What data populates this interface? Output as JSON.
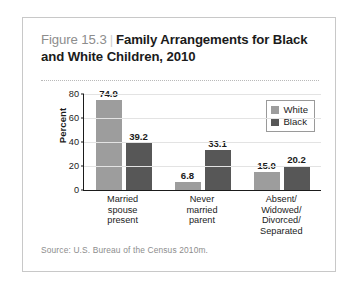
{
  "figure": {
    "number": "Figure 15.3",
    "separator": "|",
    "title": "Family Arrangements for Black and White Children, 2010",
    "source": "Source: U.S. Bureau of the Census 2010m."
  },
  "legend": {
    "position": "top-right",
    "entries": [
      {
        "label": "White",
        "color": "#9d9d9d"
      },
      {
        "label": "Black",
        "color": "#575757"
      }
    ]
  },
  "chart_data": {
    "type": "bar",
    "title": "Family Arrangements for Black and White Children, 2010",
    "xlabel": "",
    "ylabel": "Percent",
    "ylim": [
      0,
      80
    ],
    "yticks": [
      0,
      20,
      40,
      60,
      80
    ],
    "ytick_labels": [
      "0",
      "20",
      "40",
      "60",
      "80"
    ],
    "grid": true,
    "grid_axis": "y",
    "categories": [
      "Married spouse present",
      "Never married parent",
      "Absent/ Widowed/ Divorced/ Separated"
    ],
    "category_lines": [
      [
        "Married",
        "spouse",
        "present"
      ],
      [
        "Never",
        "married",
        "parent"
      ],
      [
        "Absent/",
        "Widowed/",
        "Divorced/",
        "Separated"
      ]
    ],
    "series": [
      {
        "name": "White",
        "color": "#9d9d9d",
        "values": [
          74.9,
          6.8,
          15.0
        ],
        "labels": [
          "74.9",
          "6.8",
          "15.0"
        ]
      },
      {
        "name": "Black",
        "color": "#575757",
        "values": [
          39.2,
          33.1,
          20.2
        ],
        "labels": [
          "39.2",
          "33.1",
          "20.2"
        ]
      }
    ]
  }
}
